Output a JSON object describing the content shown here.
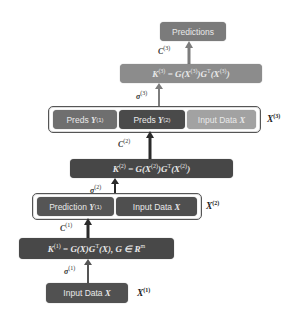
{
  "colors": {
    "predictions": "#7b7b7b",
    "k3": "#8c8c8c",
    "preds_y1_l3": "#6f6f6f",
    "preds_y2_l3": "#4a4a4a",
    "input_l3": "#a2a2a2",
    "k2": "#474747",
    "pred_y1_l2": "#555555",
    "input_l2": "#4f4f4f",
    "k1": "#484848",
    "input_l1": "#515151",
    "arrow_light": "#7d7d7d",
    "arrow_dark": "#2a2a2a"
  },
  "nodes": {
    "predictions": "Predictions",
    "k3": {
      "lhs": "K",
      "lhs_sup": "(3)",
      "eq": " = ",
      "rhs1": "G(X",
      "rhs1_sup": "(3)",
      "rhs2": ")G",
      "rhs2_sup": "T",
      "rhs3": "(X",
      "rhs3_sup": "(3)",
      "rhs4": ")"
    },
    "layer3": {
      "preds_y1": {
        "text": "Preds ",
        "var": "Y",
        "sup": "(1)"
      },
      "preds_y2": {
        "text": "Preds ",
        "var": "Y",
        "sup": "(2)"
      },
      "input": {
        "text": "Input Data ",
        "var": "X"
      },
      "side_label": {
        "var": "X",
        "sup": "(3)"
      }
    },
    "k2": {
      "lhs": "K",
      "lhs_sup": "(2)",
      "eq": " = ",
      "rhs1": "G(X",
      "rhs1_sup": "(2)",
      "rhs2": ")G",
      "rhs2_sup": "T",
      "rhs3": "(X",
      "rhs3_sup": "(2)",
      "rhs4": ")"
    },
    "layer2": {
      "pred_y1": {
        "text": "Prediction ",
        "var": "Y",
        "sup": "(1)"
      },
      "input": {
        "text": "Input Data ",
        "var": "X"
      },
      "side_label": {
        "var": "X",
        "sup": "(2)"
      }
    },
    "k1": {
      "lhs": "K",
      "lhs_sup": "(1)",
      "eq": " = ",
      "rhs": "G(X)G",
      "rhs_sup": "T",
      "rhs2": "(X), G ∈ R",
      "rhs2_sup": "m"
    },
    "layer1": {
      "input": {
        "text": "Input Data ",
        "var": "X"
      },
      "side_label": {
        "var": "X",
        "sup": "(1)"
      }
    }
  },
  "edges": {
    "c3": {
      "sym": "C",
      "sup": "(3)"
    },
    "sigma3": {
      "sym": "σ",
      "sup": "(3)"
    },
    "c2": {
      "sym": "C",
      "sup": "(2)"
    },
    "sigma2": {
      "sym": "σ",
      "sup": "(2)"
    },
    "c1": {
      "sym": "C",
      "sup": "(1)"
    },
    "sigma1": {
      "sym": "σ",
      "sup": "(1)"
    }
  }
}
